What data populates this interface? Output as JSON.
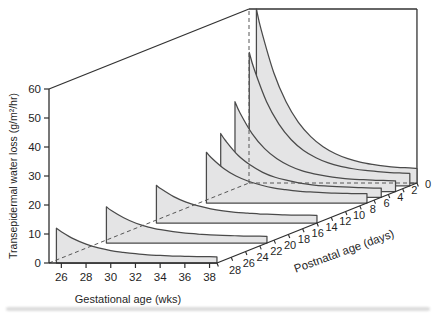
{
  "figure": {
    "canvas_color": "#ffffff",
    "axis_color": "#2e2e2e",
    "box_edge_color": "#333333",
    "curve_stroke": "#4a4a4a",
    "ribbon_fill": "#e4e4e5",
    "dashed_color": "#565656",
    "text_color": "#1f1f1f",
    "smudge_color": "#b9b9b9"
  },
  "chart_data": {
    "type": "area",
    "variant": "3d-oblique-ribbons",
    "title": "",
    "y_axis": {
      "label": "Transepidermal water loss (g/m²/hr)",
      "ticks": [
        0,
        10,
        20,
        30,
        40,
        50,
        60
      ],
      "range": [
        0,
        60
      ]
    },
    "x_axis": {
      "label": "Gestational age (wks)",
      "ticks": [
        26,
        28,
        30,
        32,
        34,
        36,
        38
      ],
      "range": [
        25,
        38.6
      ]
    },
    "z_axis": {
      "label": "Postnatal age (days)",
      "ticks": [
        28,
        26,
        24,
        22,
        20,
        18,
        16,
        14,
        12,
        10,
        8,
        6,
        4,
        2,
        0
      ],
      "range": [
        0,
        28
      ]
    },
    "grid": false,
    "legend": "none",
    "gestational_ages": [
      25.6,
      26,
      27,
      28,
      29,
      30,
      31,
      32,
      33,
      34,
      35,
      36,
      37,
      38,
      38.6
    ],
    "series": [
      {
        "postnatal_day": 0,
        "values": [
          60,
          52.6,
          38.1,
          28,
          20.9,
          16,
          12.5,
          10.1,
          8.4,
          7.2,
          6.4,
          5.8,
          5.4,
          5.2,
          5
        ]
      },
      {
        "postnatal_day": 1,
        "values": [
          46,
          40.2,
          29,
          21.3,
          15.9,
          12.2,
          9.7,
          7.9,
          6.7,
          5.9,
          5.3,
          4.9,
          4.6,
          4.4,
          4.3
        ]
      },
      {
        "postnatal_day": 3,
        "values": [
          31,
          27.2,
          19.9,
          14.8,
          11.3,
          8.9,
          7.2,
          6.1,
          5.3,
          4.7,
          4.3,
          4.1,
          3.9,
          3.8,
          3.7
        ]
      },
      {
        "postnatal_day": 5,
        "values": [
          22,
          19.5,
          14.5,
          11.1,
          8.6,
          6.9,
          5.8,
          4.9,
          4.3,
          3.9,
          3.7,
          3.5,
          3.3,
          3.2,
          3.2
        ]
      },
      {
        "postnatal_day": 7,
        "values": [
          17.5,
          15.6,
          11.9,
          9.3,
          7.5,
          6.2,
          5.2,
          4.6,
          4.1,
          3.8,
          3.6,
          3.4,
          3.3,
          3.2,
          3.2
        ]
      },
      {
        "postnatal_day": 14,
        "values": [
          13,
          11.7,
          9.1,
          7.2,
          5.9,
          4.9,
          4.2,
          3.7,
          3.4,
          3.1,
          3,
          2.8,
          2.7,
          2.7,
          2.6
        ]
      },
      {
        "postnatal_day": 21,
        "values": [
          12.5,
          11.2,
          8.7,
          6.8,
          5.5,
          4.6,
          3.9,
          3.4,
          3.1,
          2.8,
          2.6,
          2.5,
          2.4,
          2.4,
          2.3
        ]
      },
      {
        "postnatal_day": 28,
        "values": [
          12,
          10.8,
          8.3,
          6.5,
          5.2,
          4.3,
          3.7,
          3.2,
          2.8,
          2.6,
          2.4,
          2.3,
          2.2,
          2.2,
          2.1
        ]
      }
    ]
  }
}
